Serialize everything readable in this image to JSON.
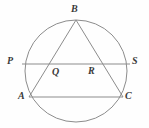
{
  "figure": {
    "width": 149,
    "height": 128,
    "background_color": "#fefefe",
    "stroke_color": "#8c8c8c",
    "label_color": "#3a3a3a"
  },
  "circle": {
    "name": "circumscribed-circle",
    "center_x": 76,
    "center_y": 71,
    "radius": 51
  },
  "points": {
    "B": {
      "label": "B",
      "x": 76,
      "y": 20,
      "label_x": 73,
      "label_y": 5
    },
    "P": {
      "label": "P",
      "x": 22,
      "y": 64,
      "label_x": 8,
      "label_y": 57
    },
    "S": {
      "label": "S",
      "x": 130,
      "y": 64,
      "label_x": 133,
      "label_y": 57
    },
    "Q": {
      "label": "Q",
      "x": 53,
      "y": 64,
      "label_x": 53,
      "label_y": 67
    },
    "R": {
      "label": "R",
      "x": 97,
      "y": 64,
      "label_x": 88,
      "label_y": 66
    },
    "A": {
      "label": "A",
      "x": 29,
      "y": 97,
      "label_x": 18,
      "label_y": 91
    },
    "C": {
      "label": "C",
      "x": 123,
      "y": 97,
      "label_x": 125,
      "label_y": 91
    }
  },
  "segments": [
    {
      "name": "segment-AB",
      "from": "A",
      "to": "B"
    },
    {
      "name": "segment-BC",
      "from": "B",
      "to": "C"
    },
    {
      "name": "segment-AC",
      "from": "A",
      "to": "C"
    },
    {
      "name": "chord-PS",
      "from": "P",
      "to": "S"
    }
  ],
  "labels_order": [
    "B",
    "P",
    "S",
    "Q",
    "R",
    "A",
    "C"
  ]
}
